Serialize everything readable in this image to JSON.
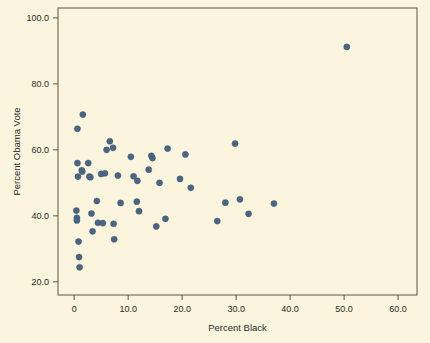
{
  "chart_data": {
    "type": "scatter",
    "title": "",
    "xlabel": "Percent Black",
    "ylabel": "Percent Obama Vote",
    "xlim": [
      -3.0,
      63.5
    ],
    "ylim": [
      16.0,
      103.0
    ],
    "grid": false,
    "legend": null,
    "marker_color": "#4a6583",
    "background_color": "#faf5dc",
    "axis_color": "#6b6450",
    "xticks": [
      0,
      10,
      20,
      30,
      40,
      50,
      60
    ],
    "xtick_labels": [
      "0",
      "10.0",
      "20.0",
      "30.0",
      "40.0",
      "50.0",
      "60.0"
    ],
    "yticks": [
      20,
      40,
      60,
      80,
      100
    ],
    "ytick_labels": [
      "20.0",
      "40.0",
      "60.0",
      "80.0",
      "100.0"
    ],
    "points": [
      {
        "x": 0.4,
        "y": 41.6
      },
      {
        "x": 0.5,
        "y": 39.4
      },
      {
        "x": 0.5,
        "y": 38.6
      },
      {
        "x": 0.6,
        "y": 56.0
      },
      {
        "x": 0.6,
        "y": 66.4
      },
      {
        "x": 0.7,
        "y": 51.9
      },
      {
        "x": 0.8,
        "y": 32.2
      },
      {
        "x": 0.9,
        "y": 27.5
      },
      {
        "x": 1.0,
        "y": 24.4
      },
      {
        "x": 1.4,
        "y": 53.8
      },
      {
        "x": 1.5,
        "y": 53.4
      },
      {
        "x": 1.6,
        "y": 70.7
      },
      {
        "x": 2.6,
        "y": 56.0
      },
      {
        "x": 2.8,
        "y": 51.9
      },
      {
        "x": 3.0,
        "y": 51.7
      },
      {
        "x": 3.2,
        "y": 40.7
      },
      {
        "x": 3.4,
        "y": 35.3
      },
      {
        "x": 4.2,
        "y": 44.5
      },
      {
        "x": 4.4,
        "y": 37.9
      },
      {
        "x": 5.0,
        "y": 52.7
      },
      {
        "x": 5.3,
        "y": 37.8
      },
      {
        "x": 5.7,
        "y": 52.9
      },
      {
        "x": 6.0,
        "y": 60.0
      },
      {
        "x": 6.6,
        "y": 62.6
      },
      {
        "x": 7.2,
        "y": 60.6
      },
      {
        "x": 7.3,
        "y": 37.6
      },
      {
        "x": 7.4,
        "y": 32.9
      },
      {
        "x": 8.1,
        "y": 52.2
      },
      {
        "x": 8.6,
        "y": 43.9
      },
      {
        "x": 10.5,
        "y": 57.9
      },
      {
        "x": 11.0,
        "y": 52.0
      },
      {
        "x": 11.6,
        "y": 44.3
      },
      {
        "x": 11.7,
        "y": 50.6
      },
      {
        "x": 12.0,
        "y": 41.4
      },
      {
        "x": 13.8,
        "y": 54.0
      },
      {
        "x": 14.3,
        "y": 58.2
      },
      {
        "x": 14.5,
        "y": 57.5
      },
      {
        "x": 15.2,
        "y": 36.8
      },
      {
        "x": 15.8,
        "y": 50.0
      },
      {
        "x": 16.9,
        "y": 39.1
      },
      {
        "x": 17.3,
        "y": 60.4
      },
      {
        "x": 19.6,
        "y": 51.2
      },
      {
        "x": 20.6,
        "y": 58.6
      },
      {
        "x": 21.6,
        "y": 48.5
      },
      {
        "x": 26.5,
        "y": 38.4
      },
      {
        "x": 28.0,
        "y": 44.0
      },
      {
        "x": 29.8,
        "y": 61.9
      },
      {
        "x": 30.7,
        "y": 45.0
      },
      {
        "x": 32.3,
        "y": 40.6
      },
      {
        "x": 37.0,
        "y": 43.7
      },
      {
        "x": 50.5,
        "y": 91.2
      }
    ]
  }
}
